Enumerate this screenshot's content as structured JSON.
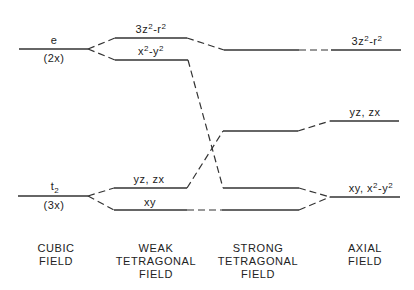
{
  "diagram": {
    "title": "",
    "columns": [
      {
        "id": "cubic",
        "lines": [
          "CUBIC",
          "FIELD"
        ]
      },
      {
        "id": "weak",
        "lines": [
          "WEAK",
          "TETRAGONAL",
          "FIELD"
        ]
      },
      {
        "id": "strong",
        "lines": [
          "STRONG",
          "TETRAGONAL",
          "FIELD"
        ]
      },
      {
        "id": "axial",
        "lines": [
          "AXIAL",
          "FIELD"
        ]
      }
    ],
    "levels": {
      "cubic_e": {
        "label": "e",
        "degeneracy": "(2x)"
      },
      "cubic_t2": {
        "label": "t",
        "sub": "2",
        "degeneracy": "(3x)"
      },
      "weak_z2": {
        "base": "3z",
        "mid": "-r",
        "label": "3z2-r2"
      },
      "weak_x2y2": {
        "base": "x",
        "mid": "-y",
        "label": "x2-y2"
      },
      "weak_yzzx": {
        "label": "yz, zx"
      },
      "weak_xy": {
        "label": "xy"
      },
      "axial_z2": {
        "base": "3z",
        "mid": "-r",
        "label": "3z2-r2"
      },
      "axial_yzzx": {
        "label": "yz, zx"
      },
      "axial_xy_x2y2": {
        "pre": "xy, x",
        "mid": "-y",
        "label": "xy, x2-y2"
      }
    },
    "sup2": "2",
    "line_color": "#333333"
  }
}
